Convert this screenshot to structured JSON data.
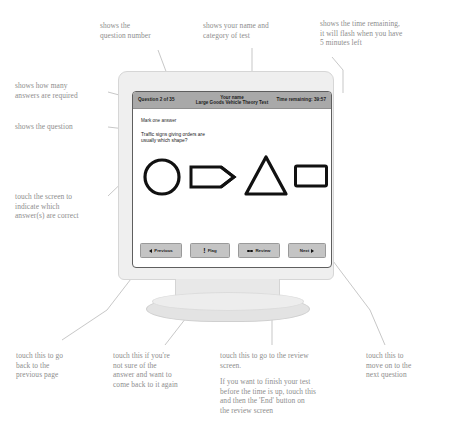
{
  "screen": {
    "header": {
      "question_counter": "Question 2 of 35",
      "name_line": "Your name",
      "test_line": "Large Goods Vehicle Theory Test",
      "timer": "Time remaining: 39:57"
    },
    "instruction": "Mark one answer",
    "question_text": "Traffic signs giving orders are\nusually which shape?",
    "answers": [
      {
        "name": "circle",
        "shape": "circle"
      },
      {
        "name": "arrow-pennant",
        "shape": "pennant"
      },
      {
        "name": "triangle",
        "shape": "triangle"
      },
      {
        "name": "rectangle",
        "shape": "rectangle"
      }
    ],
    "buttons": [
      {
        "label": "Previous",
        "icon": "left-arrow-icon"
      },
      {
        "label": "Flag",
        "icon": "exclamation-icon"
      },
      {
        "label": "Review",
        "icon": "dots-icon"
      },
      {
        "label": "Next",
        "icon": "right-arrow-icon"
      }
    ]
  },
  "annotations": {
    "question_number": "shows the\nquestion number",
    "name_category": "shows your name and\ncategory of test",
    "time_remaining": "shows the time remaining,\nit will flash when you have\n5 minutes left",
    "answers_required": "shows how many\nanswers are required",
    "the_question": "shows the question",
    "touch_screen": "touch the screen to\nindicate which\nanswer(s) are correct",
    "previous_button": "touch this to go\nback to the\nprevious page",
    "flag_button": "touch this if you're\nnot sure of the\nanswer and want to\ncome back to it again",
    "review_button_p1": "touch this to go to the review\nscreen.",
    "review_button_p2": "If you want to finish your test\nbefore the time is up, touch this\nand then the 'End' button on\nthe review screen",
    "next_button": "touch this to\nmove on to the\nnext question"
  },
  "colors": {
    "annotation_text": "#8d8d8d",
    "header_bar": "#a9a9a9",
    "button_face": "#c4c4c4",
    "monitor_body": "#efefef",
    "shape_outline": "#111111"
  }
}
